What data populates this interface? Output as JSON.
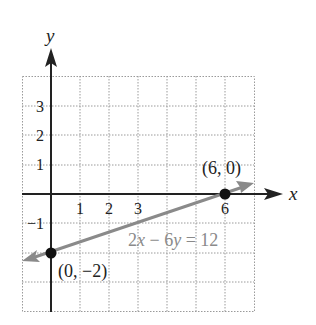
{
  "figure": {
    "axis_labels": {
      "x": "x",
      "y": "y"
    },
    "x_ticks": [
      {
        "value": 1,
        "label": "1"
      },
      {
        "value": 2,
        "label": "2"
      },
      {
        "value": 3,
        "label": "3"
      },
      {
        "value": 6,
        "label": "6"
      }
    ],
    "y_ticks": [
      {
        "value": 3,
        "label": "3"
      },
      {
        "value": 2,
        "label": "2"
      },
      {
        "value": 1,
        "label": "1"
      },
      {
        "value": -1,
        "label": "−1"
      }
    ],
    "points": [
      {
        "x": 6,
        "y": 0,
        "label": "(6, 0)"
      },
      {
        "x": 0,
        "y": -2,
        "label": "(0, −2)"
      }
    ],
    "line": {
      "equation_label": "2x − 6y = 12",
      "equation_parts": [
        "2",
        "x",
        " − 6",
        "y",
        " = 12"
      ],
      "color": "#8a8a8a"
    },
    "grid": {
      "x_range": [
        -1,
        7
      ],
      "y_range": [
        -4,
        4
      ],
      "style": "dotted"
    },
    "colors": {
      "axes": "#222222",
      "grid": "#9a9a9a",
      "points": "#111111"
    }
  }
}
